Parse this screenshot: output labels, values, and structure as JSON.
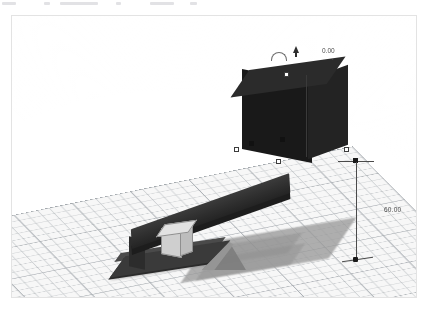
{
  "app": {
    "title": "3D CAD Viewport",
    "kind": "cad-3d-editor"
  },
  "viewport": {
    "background_color": "#ffffff",
    "frame_color": "#e3e3e3"
  },
  "workplane": {
    "name": "workplane-grid",
    "fill_color": "#f7f7f7",
    "minor_grid_color": "#aaafb4",
    "major_grid_color": "#969ba2",
    "minor_step_px": 11,
    "major_step_px": 55
  },
  "annotations": {
    "height_dimension": {
      "value": "60.00",
      "axis": "z",
      "line_color": "#4a4a4a"
    },
    "angle_readout": {
      "value": "0.00",
      "ticks": "· ·"
    },
    "base_dimension": {
      "value": "— —"
    }
  },
  "handles": {
    "color": "#ffffff",
    "stroke": "#3c3c3c",
    "rotation_arc": "rotation-arc-handle",
    "height_cone": "height-cone-handle"
  },
  "objects": [
    {
      "id": "elevated-cube",
      "label": "Elevated Box",
      "color": "#191919",
      "selected": true,
      "elevation": "60.00"
    },
    {
      "id": "inclined-ramp",
      "label": "Inclined Plank",
      "color": "#2e2e2e",
      "selected": false
    },
    {
      "id": "small-cube",
      "label": "Small Cube",
      "color": "#cfcfcf",
      "selected": false
    },
    {
      "id": "support-wedge",
      "label": "Support Wedge",
      "color": "#7e7e7e",
      "selected": false
    },
    {
      "id": "base-block",
      "label": "Base Block",
      "color": "#3a3a3a",
      "selected": false
    }
  ],
  "shadows": {
    "color": "#9a9a9a",
    "opacity": "0.75"
  }
}
